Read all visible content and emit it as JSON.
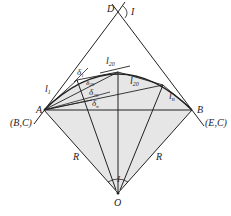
{
  "diagram": {
    "points": {
      "D": {
        "label": "D",
        "x": 118,
        "y": 12
      },
      "A": {
        "label": "A",
        "x": 44,
        "y": 110
      },
      "B": {
        "label": "B",
        "x": 192,
        "y": 110
      },
      "O": {
        "label": "O",
        "x": 118,
        "y": 193
      }
    },
    "labels": {
      "D": "D",
      "I_top": "I",
      "A": "A",
      "B": "B",
      "BC": "(B,C)",
      "EC": "(E,C)",
      "R_left": "R",
      "R_right": "R",
      "I_bottom": "I",
      "O": "O",
      "l1": "l",
      "l1_sub": "1",
      "l20_top": "l",
      "l20_top_sub": "20",
      "l20_mid": "l",
      "l20_mid_sub": "20",
      "ln": "l",
      "ln_sub": "n",
      "delta1": "δ",
      "delta1_sub": "1",
      "delta20a": "δ",
      "delta20a_sub": "20",
      "delta20b": "δ",
      "delta20b_sub": "20",
      "deltan": "δ",
      "deltan_sub": "n"
    },
    "colors": {
      "line": "#222222",
      "shade": "#e6e6e6"
    }
  }
}
